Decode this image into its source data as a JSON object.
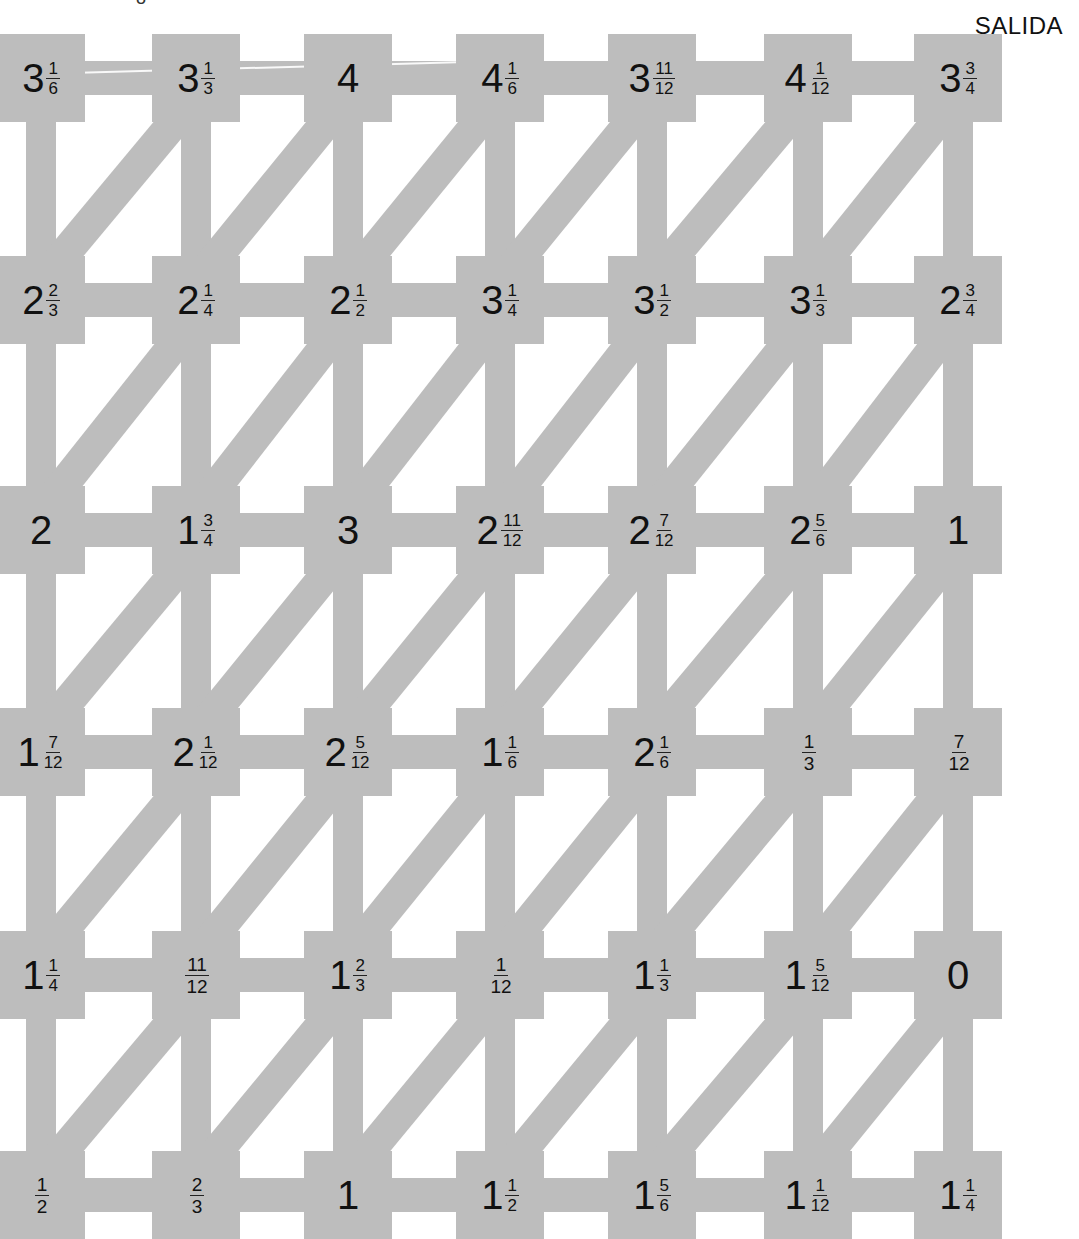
{
  "puzzle": {
    "exit_label": "SALIDA",
    "top_partial_glyph": "8",
    "grid_columns": 7,
    "grid_rows": 6,
    "colors": {
      "path": "#bdbdbd",
      "background": "#ffffff",
      "text": "#111111"
    },
    "connections": "horizontal, vertical, and diagonal (lower-left to upper-right) between adjacent nodes",
    "rows": [
      [
        {
          "w": "3",
          "n": "1",
          "d": "6"
        },
        {
          "w": "3",
          "n": "1",
          "d": "3"
        },
        {
          "w": "4",
          "n": "",
          "d": ""
        },
        {
          "w": "4",
          "n": "1",
          "d": "6"
        },
        {
          "w": "3",
          "n": "11",
          "d": "12"
        },
        {
          "w": "4",
          "n": "1",
          "d": "12"
        },
        {
          "w": "3",
          "n": "3",
          "d": "4"
        }
      ],
      [
        {
          "w": "2",
          "n": "2",
          "d": "3"
        },
        {
          "w": "2",
          "n": "1",
          "d": "4"
        },
        {
          "w": "2",
          "n": "1",
          "d": "2"
        },
        {
          "w": "3",
          "n": "1",
          "d": "4"
        },
        {
          "w": "3",
          "n": "1",
          "d": "2"
        },
        {
          "w": "3",
          "n": "1",
          "d": "3"
        },
        {
          "w": "2",
          "n": "3",
          "d": "4"
        }
      ],
      [
        {
          "w": "2",
          "n": "",
          "d": ""
        },
        {
          "w": "1",
          "n": "3",
          "d": "4"
        },
        {
          "w": "3",
          "n": "",
          "d": ""
        },
        {
          "w": "2",
          "n": "11",
          "d": "12"
        },
        {
          "w": "2",
          "n": "7",
          "d": "12"
        },
        {
          "w": "2",
          "n": "5",
          "d": "6"
        },
        {
          "w": "1",
          "n": "",
          "d": ""
        }
      ],
      [
        {
          "w": "1",
          "n": "7",
          "d": "12"
        },
        {
          "w": "2",
          "n": "1",
          "d": "12"
        },
        {
          "w": "2",
          "n": "5",
          "d": "12"
        },
        {
          "w": "1",
          "n": "1",
          "d": "6"
        },
        {
          "w": "2",
          "n": "1",
          "d": "6"
        },
        {
          "w": "",
          "n": "1",
          "d": "3"
        },
        {
          "w": "",
          "n": "7",
          "d": "12"
        }
      ],
      [
        {
          "w": "1",
          "n": "1",
          "d": "4"
        },
        {
          "w": "",
          "n": "11",
          "d": "12"
        },
        {
          "w": "1",
          "n": "2",
          "d": "3"
        },
        {
          "w": "",
          "n": "1",
          "d": "12"
        },
        {
          "w": "1",
          "n": "1",
          "d": "3"
        },
        {
          "w": "1",
          "n": "5",
          "d": "12"
        },
        {
          "w": "0",
          "n": "",
          "d": ""
        }
      ],
      [
        {
          "w": "",
          "n": "1",
          "d": "2"
        },
        {
          "w": "",
          "n": "2",
          "d": "3"
        },
        {
          "w": "1",
          "n": "",
          "d": ""
        },
        {
          "w": "1",
          "n": "1",
          "d": "2"
        },
        {
          "w": "1",
          "n": "5",
          "d": "6"
        },
        {
          "w": "1",
          "n": "1",
          "d": "12"
        },
        {
          "w": "1",
          "n": "1",
          "d": "4"
        }
      ]
    ]
  }
}
